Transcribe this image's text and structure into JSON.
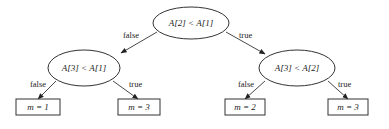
{
  "diagram": {
    "type": "decision-tree",
    "colors": {
      "stroke": "#333333",
      "text": "#222222",
      "background": "#ffffff"
    },
    "nodes": {
      "root": {
        "label": "A[2] < A[1]",
        "shape": "ellipse"
      },
      "left": {
        "label": "A[3] < A[1]",
        "shape": "ellipse"
      },
      "right": {
        "label": "A[3] < A[2]",
        "shape": "ellipse"
      },
      "leaf_ll": {
        "label": "m = 1",
        "shape": "rectangle"
      },
      "leaf_lr": {
        "label": "m = 3",
        "shape": "rectangle"
      },
      "leaf_rl": {
        "label": "m = 2",
        "shape": "rectangle"
      },
      "leaf_rr": {
        "label": "m = 3",
        "shape": "rectangle"
      }
    },
    "edges": {
      "root_left": {
        "from": "root",
        "to": "left",
        "label": "false"
      },
      "root_right": {
        "from": "root",
        "to": "right",
        "label": "true"
      },
      "left_ll": {
        "from": "left",
        "to": "leaf_ll",
        "label": "false"
      },
      "left_lr": {
        "from": "left",
        "to": "leaf_lr",
        "label": "true"
      },
      "right_rl": {
        "from": "right",
        "to": "leaf_rl",
        "label": "false"
      },
      "right_rr": {
        "from": "right",
        "to": "leaf_rr",
        "label": "true"
      }
    }
  }
}
